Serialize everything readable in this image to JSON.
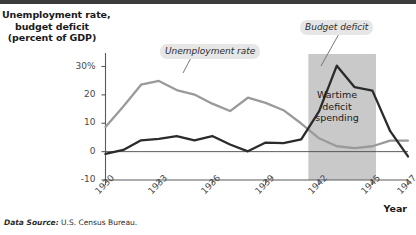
{
  "figure": {
    "y_axis_title_lines": [
      "Unemployment rate,",
      "budget deficit",
      "(percent of GDP)"
    ],
    "x_axis_title": "Year",
    "source_lead": "Data Source:",
    "source_text": " U.S. Census Bureau.",
    "band_label_lines": [
      "Wartime",
      "deficit",
      "spending"
    ],
    "callouts": {
      "unemployment": "Unemployment rate",
      "budget": "Budget deficit"
    }
  },
  "chart_data": {
    "type": "line",
    "title": "",
    "xlabel": "Year",
    "ylabel": "Unemployment rate, budget deficit (percent of GDP)",
    "xlim": [
      1930,
      1947
    ],
    "ylim": [
      -10,
      33
    ],
    "ytick_values": [
      30,
      20,
      10,
      0,
      -10
    ],
    "ytick_labels": [
      "30%",
      "20",
      "10",
      "0",
      "-10"
    ],
    "xtick_values": [
      1930,
      1933,
      1936,
      1939,
      1942,
      1945,
      1947
    ],
    "xtick_labels": [
      "1930",
      "1933",
      "1936",
      "1939",
      "1942",
      "1945",
      "1947"
    ],
    "grid": false,
    "legend_position": "inline-callouts",
    "zero_line": 0,
    "shaded_region": {
      "label": "Wartime deficit spending",
      "x_start": 1941.4,
      "x_end": 1945.2,
      "color": "#c9c9c9"
    },
    "colors": {
      "unemployment": "#9a9a9a",
      "budget": "#2b2b2b",
      "band": "#c9c9c9",
      "callout_bg": "#e6e6e6",
      "axis": "#4a4a4a"
    },
    "x": [
      1930,
      1931,
      1932,
      1933,
      1934,
      1935,
      1936,
      1937,
      1938,
      1939,
      1940,
      1941,
      1942,
      1943,
      1944,
      1945,
      1946,
      1947
    ],
    "series": [
      {
        "name": "Unemployment rate",
        "color": "#9a9a9a",
        "values": [
          8.7,
          15.9,
          23.6,
          24.9,
          21.7,
          20.1,
          16.9,
          14.3,
          19.0,
          17.2,
          14.6,
          9.9,
          4.7,
          1.9,
          1.2,
          1.9,
          3.9,
          3.9
        ]
      },
      {
        "name": "Budget deficit",
        "color": "#2b2b2b",
        "values": [
          -0.8,
          0.6,
          4.0,
          4.5,
          5.5,
          4.0,
          5.5,
          2.5,
          0.1,
          3.2,
          3.0,
          4.3,
          14.2,
          30.3,
          22.7,
          21.5,
          7.2,
          -1.7
        ]
      }
    ]
  }
}
